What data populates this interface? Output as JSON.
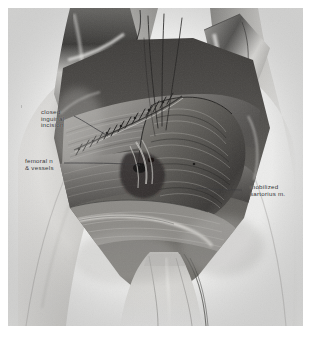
{
  "figure": {
    "type": "medical-surgical-illustration",
    "medium": "graphite / wash drawing, grayscale",
    "plate_background": "#ececeb",
    "page_background": "#ffffff",
    "label_color": "#2e2e30",
    "leader_line_color": "#3a3a3c"
  },
  "labels": [
    {
      "name": "closed-inguinal-incision",
      "lines": [
        "closed",
        "inguinal",
        "incision"
      ],
      "text": "closed inguinal incision",
      "position": "upper-left",
      "leader": "descends right to the sutured incision line"
    },
    {
      "name": "femoral-nerve-and-vessels",
      "lines": [
        "femoral n",
        "& vessels"
      ],
      "text": "femoral n & vessels",
      "position": "mid-left",
      "leader": "runs right, nearly horizontal, into the femoral triangle"
    },
    {
      "name": "mobilized-sartorius-muscle",
      "lines": [
        "mobilized",
        "sartorius m."
      ],
      "text": "mobilized sartorius m.",
      "position": "mid-right",
      "leader": "runs left, horizontal, to the rotated muscle belly"
    }
  ],
  "anatomy": [
    "closed inguinal incision with interrupted sutures",
    "femoral nerve and vessels",
    "mobilized sartorius muscle",
    "retracted skin flaps",
    "medial thigh",
    "suture threads held superiorly"
  ]
}
